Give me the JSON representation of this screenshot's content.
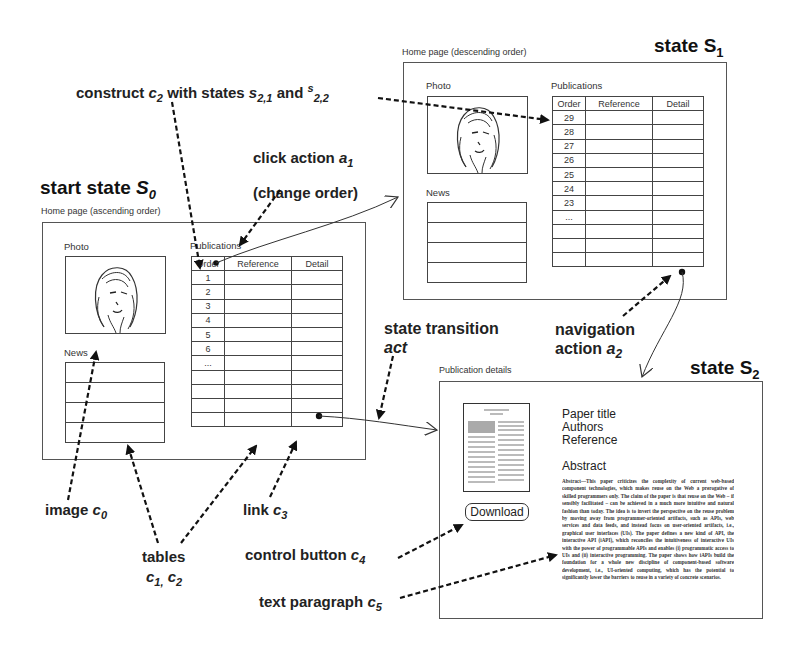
{
  "labels": {
    "construct": {
      "prefix": "construct ",
      "c": "c",
      "c_sub": "2",
      "mid": " with states ",
      "s1": "s",
      "s1_sub": "2,1",
      "and": " and ",
      "s2": "s",
      "s2_sub": "2,2"
    },
    "click_action": {
      "line1": "click action ",
      "a": "a",
      "a_sub": "1",
      "line2": "(change order)"
    },
    "start_state": {
      "text": "start state ",
      "s": "S",
      "s_sub": "0"
    },
    "state_s1": {
      "text": "state S",
      "sub": "1"
    },
    "state_s2": {
      "text": "state S",
      "sub": "2"
    },
    "state_transition": {
      "line1": "state transition",
      "line2": "act"
    },
    "navigation_action": {
      "line1": "navigation",
      "line2": "action ",
      "a": "a",
      "a_sub": "2"
    },
    "image": {
      "text": "image ",
      "c": "c",
      "c_sub": "0"
    },
    "tables": {
      "line1": "tables",
      "c1": "c",
      "c1_sub": "1,",
      "c2": " c",
      "c2_sub": "2"
    },
    "link": {
      "text": "link ",
      "c": "c",
      "c_sub": "3"
    },
    "control_button": {
      "text": "control button ",
      "c": "c",
      "c_sub": "4"
    },
    "text_paragraph": {
      "text": "text paragraph ",
      "c": "c",
      "c_sub": "5"
    }
  },
  "s0": {
    "caption": "Home page (ascending order)",
    "photo_label": "Photo",
    "news_label": "News",
    "publications_label": "Publications",
    "table_headers": [
      "Order",
      "Reference",
      "Detail"
    ],
    "orders": [
      "1",
      "2",
      "3",
      "4",
      "5",
      "6",
      "...",
      "",
      "",
      "",
      ""
    ]
  },
  "s1": {
    "caption": "Home page (descending order)",
    "photo_label": "Photo",
    "news_label": "News",
    "publications_label": "Publications",
    "table_headers": [
      "Order",
      "Reference",
      "Detail"
    ],
    "orders": [
      "29",
      "28",
      "27",
      "26",
      "25",
      "24",
      "23",
      "...",
      "",
      "",
      ""
    ]
  },
  "s2": {
    "caption": "Publication details",
    "paper_title": "Paper title",
    "authors": "Authors",
    "reference": "Reference",
    "abstract_heading": "Abstract",
    "abstract_text": "Abstract—This paper criticizes the complexity of current web-based component technologies, which makes reuse on the Web a prerogative of skilled programmers only. The claim of the paper is that reuse on the Web – if sensibly facilitated – can be achieved in a much more intuitive and natural fashion than today. The idea is to invert the perspective on the reuse problem by moving away from programmer-oriented artifacts, such as APIs, web services and data feeds, and instead focus on user-oriented artifacts, i.e., graphical user interfaces (UIs). The paper defines a new kind of API, the interactive API (iAPI), which reconciles the intuitiveness of interactive UIs with the power of programmable APIs and enables (i) programmatic access to UIs and (ii) interactive programming. The paper shows how iAPIs build the foundation for a whole new discipline of component-based software development, i.e., UI-oriented computing, which has the potential to significantly lower the barriers to reuse in a variety of concrete scenarios.",
    "download_label": "Download"
  },
  "colors": {
    "ink": "#1a1a1a",
    "frame": "#555555",
    "background": "#ffffff"
  }
}
